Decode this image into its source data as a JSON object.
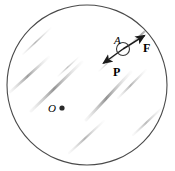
{
  "figure": {
    "background_color": "#ffffff",
    "outline_color": "#4a4a4a",
    "streak_color": "#9a9a9a",
    "arrow_color": "#1a1a1a",
    "label_color": "#000000"
  },
  "disk": {
    "name": "disk",
    "center_x": 87,
    "center_y": 85,
    "radius": 80,
    "stroke_width": 1.1
  },
  "center_point": {
    "label": "O",
    "dot_x": 62,
    "dot_y": 108,
    "dot_radius": 2.6,
    "label_x": 48,
    "label_y": 112,
    "font_size": 11
  },
  "point_a": {
    "label": "A",
    "circle_x": 123,
    "circle_y": 49,
    "circle_radius": 6.5,
    "label_x": 114,
    "label_y": 44,
    "font_size": 11
  },
  "vector_f": {
    "label": "F",
    "tail_x": 123,
    "tail_y": 49,
    "tip_x": 147,
    "tip_y": 34,
    "label_x": 143,
    "label_y": 52,
    "font_size": 12
  },
  "vector_p": {
    "label": "P",
    "tail_x": 123,
    "tail_y": 49,
    "tip_x": 101,
    "tip_y": 65,
    "label_x": 113,
    "label_y": 76,
    "font_size": 12
  },
  "streaks": {
    "angle_degrees": -42,
    "marks": [
      {
        "x1": 23,
        "y1": 54,
        "x2": 51,
        "y2": 28,
        "w": 1.6,
        "o": 0.55
      },
      {
        "x1": 10,
        "y1": 92,
        "x2": 49,
        "y2": 57,
        "w": 2.4,
        "o": 0.7
      },
      {
        "x1": 31,
        "y1": 111,
        "x2": 82,
        "y2": 62,
        "w": 2.8,
        "o": 0.78
      },
      {
        "x1": 58,
        "y1": 76,
        "x2": 79,
        "y2": 57,
        "w": 1.5,
        "o": 0.45
      },
      {
        "x1": 86,
        "y1": 120,
        "x2": 131,
        "y2": 72,
        "w": 2.8,
        "o": 0.8
      },
      {
        "x1": 118,
        "y1": 98,
        "x2": 146,
        "y2": 70,
        "w": 2.0,
        "o": 0.55
      },
      {
        "x1": 129,
        "y1": 46,
        "x2": 157,
        "y2": 20,
        "w": 2.2,
        "o": 0.62
      },
      {
        "x1": 69,
        "y1": 153,
        "x2": 104,
        "y2": 121,
        "w": 2.2,
        "o": 0.55
      },
      {
        "x1": 133,
        "y1": 135,
        "x2": 162,
        "y2": 108,
        "w": 2.0,
        "o": 0.5
      },
      {
        "x1": 99,
        "y1": 71,
        "x2": 117,
        "y2": 54,
        "w": 1.3,
        "o": 0.4
      }
    ]
  }
}
